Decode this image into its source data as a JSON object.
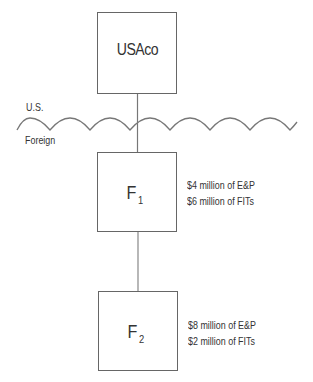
{
  "diagram": {
    "regions": {
      "upper_label": "U.S.",
      "lower_label": "Foreign"
    },
    "entities": [
      {
        "id": "usaco",
        "name": "USAco",
        "subscript": "",
        "attributes": []
      },
      {
        "id": "f1",
        "name": "F",
        "subscript": "1",
        "attributes": [
          "$4 million of E&P",
          "$6 million of FITs"
        ]
      },
      {
        "id": "f2",
        "name": "F",
        "subscript": "2",
        "attributes": [
          "$8 million of E&P",
          "$2 million of FITs"
        ]
      }
    ],
    "connections": [
      {
        "from": "USAco",
        "to": "F1"
      },
      {
        "from": "F1",
        "to": "F2"
      }
    ],
    "colors": {
      "line": "#666666",
      "text": "#333333",
      "background": "#ffffff"
    }
  }
}
